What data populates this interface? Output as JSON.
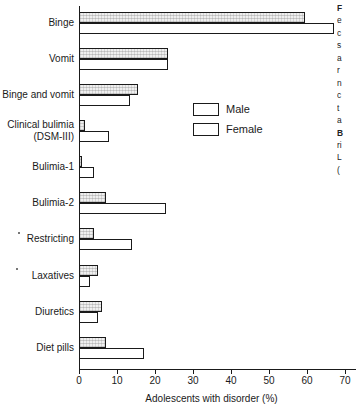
{
  "chart_data": {
    "type": "bar",
    "orientation": "horizontal",
    "title": "",
    "xlabel": "Adolescents with disorder (%)",
    "ylabel": "",
    "xlim": [
      0,
      73
    ],
    "xticks": [
      0,
      10,
      20,
      30,
      40,
      50,
      60,
      70
    ],
    "grid": false,
    "legend_position": "upper-center-right",
    "categories": [
      "Binge",
      "Vomit",
      "Binge and vomit",
      "Clinical bulimia\n(DSM-III)",
      "Bulimia-1",
      "Bulimia-2",
      "Restricting",
      "Laxatives",
      "Diuretics",
      "Diet pills"
    ],
    "series": [
      {
        "name": "Male",
        "values": [
          59.5,
          23.5,
          15.5,
          1.5,
          0.8,
          7.0,
          4.0,
          5.0,
          6.0,
          7.0
        ]
      },
      {
        "name": "Female",
        "values": [
          67.0,
          23.5,
          13.5,
          8.0,
          4.0,
          23.0,
          14.0,
          3.0,
          5.0,
          17.0
        ]
      }
    ],
    "colors": {
      "male": "#efefef",
      "female": "#ffffff",
      "outline": "#1a1a1a"
    }
  },
  "axis": {
    "x_title": "Adolescents with disorder (%)",
    "tick_labels": [
      "0",
      "10",
      "20",
      "30",
      "40",
      "50",
      "60",
      "70"
    ]
  },
  "legend": {
    "male_label": "Male",
    "female_label": "Female"
  },
  "caption": {
    "lines": [
      "F",
      "e",
      "c",
      "s",
      "a",
      "r",
      "n",
      "c",
      "t",
      "a",
      "B",
      "ri",
      "L",
      "("
    ]
  }
}
